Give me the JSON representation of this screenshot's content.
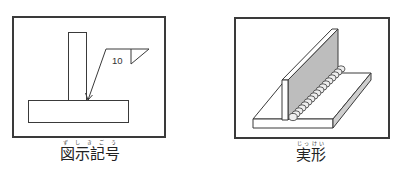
{
  "figures": [
    {
      "id": "symbol",
      "caption": "図示記号",
      "caption_reading": "ずしきごう",
      "weld_size_label": "10",
      "weld_type": "fillet-weld-symbol"
    },
    {
      "id": "actual",
      "caption": "実形",
      "caption_reading": "じっけい",
      "weld_type": "fillet-weld-t-joint-isometric"
    }
  ],
  "colors": {
    "line": "#3a3a3a",
    "shade": "#bdbdbd",
    "bead": "#e6e6e6"
  }
}
